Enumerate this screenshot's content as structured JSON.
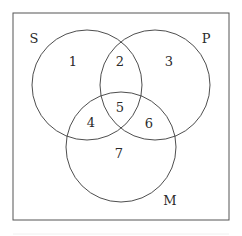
{
  "diagram": {
    "type": "venn",
    "frame": {
      "x": 13,
      "y": 13,
      "width": 216,
      "height": 207,
      "stroke": "#555555"
    },
    "sets": [
      {
        "name": "S",
        "cx": 87,
        "cy": 85,
        "r": 55,
        "label": "S",
        "label_x": 34,
        "label_y": 43
      },
      {
        "name": "P",
        "cx": 155,
        "cy": 85,
        "r": 55,
        "label": "P",
        "label_x": 206,
        "label_y": 43
      },
      {
        "name": "M",
        "cx": 121,
        "cy": 147,
        "r": 55,
        "label": "M",
        "label_x": 170,
        "label_y": 205
      }
    ],
    "regions": [
      {
        "id": "1",
        "label": "1",
        "x": 73,
        "y": 66,
        "membership": "S only"
      },
      {
        "id": "2",
        "label": "2",
        "x": 120,
        "y": 66,
        "membership": "S and P"
      },
      {
        "id": "3",
        "label": "3",
        "x": 169,
        "y": 66,
        "membership": "P only"
      },
      {
        "id": "4",
        "label": "4",
        "x": 91,
        "y": 127,
        "membership": "S and M"
      },
      {
        "id": "5",
        "label": "5",
        "x": 120,
        "y": 112,
        "membership": "S, P and M"
      },
      {
        "id": "6",
        "label": "6",
        "x": 149,
        "y": 128,
        "membership": "P and M"
      },
      {
        "id": "7",
        "label": "7",
        "x": 119,
        "y": 158,
        "membership": "M only"
      }
    ],
    "stroke_color": "#3a3a3a",
    "text_color": "#2a2a2a"
  }
}
